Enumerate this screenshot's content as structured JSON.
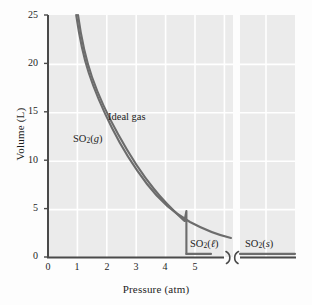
{
  "chart_data": {
    "type": "line",
    "title": "",
    "xlabel": "Pressure (atm)",
    "ylabel": "Volume (L)",
    "xlim": [
      0,
      9
    ],
    "ylim": [
      0,
      25
    ],
    "xticks": [
      "0",
      "1",
      "2",
      "3",
      "4",
      "5"
    ],
    "yticks": [
      "0",
      "5",
      "10",
      "15",
      "20",
      "25"
    ],
    "grid": true,
    "grid_color": "#ffffff",
    "plot_background": "#ebebeb",
    "axis_break": {
      "present": true,
      "symbol": ")(",
      "x_position": 5.6,
      "note": "x-axis is broken after 5 atm"
    },
    "series": [
      {
        "name": "Ideal gas",
        "color": "#6c6c6c",
        "label_x": 2.05,
        "label_y": 13.4,
        "comment": "PV = nRT hyperbola, continues smoothly past condensation pressure",
        "points": [
          [
            0.96,
            25.0
          ],
          [
            1.0,
            24.0
          ],
          [
            1.1,
            21.8
          ],
          [
            1.2,
            20.0
          ],
          [
            1.3,
            18.5
          ],
          [
            1.4,
            17.1
          ],
          [
            1.5,
            16.0
          ],
          [
            1.6,
            15.0
          ],
          [
            1.7,
            14.1
          ],
          [
            1.8,
            13.3
          ],
          [
            2.0,
            12.0
          ],
          [
            2.2,
            10.9
          ],
          [
            2.4,
            10.0
          ],
          [
            2.6,
            9.2
          ],
          [
            2.8,
            8.6
          ],
          [
            3.0,
            8.0
          ],
          [
            3.25,
            7.4
          ],
          [
            3.5,
            6.9
          ],
          [
            3.75,
            6.4
          ],
          [
            4.0,
            6.0
          ],
          [
            4.25,
            5.65
          ],
          [
            4.5,
            5.35
          ],
          [
            4.6,
            5.22
          ],
          [
            5.0,
            4.8
          ],
          [
            5.4,
            4.45
          ],
          [
            5.8,
            4.2
          ],
          [
            6.0,
            4.1
          ]
        ]
      },
      {
        "name": "SO2(g)",
        "color": "#6c6c6c",
        "label_x": 1.05,
        "label_y": 12.1,
        "comment": "Real gas curve lies below ideal, drops vertically at condensation pressure 4.6 atm",
        "points": [
          [
            1.02,
            25.0
          ],
          [
            1.1,
            22.8
          ],
          [
            1.2,
            20.3
          ],
          [
            1.3,
            18.4
          ],
          [
            1.4,
            16.9
          ],
          [
            1.5,
            15.7
          ],
          [
            1.6,
            14.6
          ],
          [
            1.7,
            13.7
          ],
          [
            1.8,
            12.9
          ],
          [
            2.0,
            11.5
          ],
          [
            2.2,
            10.4
          ],
          [
            2.4,
            9.4
          ],
          [
            2.6,
            8.6
          ],
          [
            2.8,
            7.9
          ],
          [
            3.0,
            7.3
          ],
          [
            3.25,
            6.7
          ],
          [
            3.5,
            6.1
          ],
          [
            3.75,
            5.65
          ],
          [
            4.0,
            5.3
          ],
          [
            4.25,
            5.0
          ],
          [
            4.45,
            4.85
          ],
          [
            4.6,
            4.75
          ]
        ],
        "condensation_pressure": 4.6,
        "condensation_volume_gas": 4.75,
        "condensation_volume_liquid": 0.32
      },
      {
        "name": "SO2(l)",
        "color": "#6c6c6c",
        "label_x": 5.02,
        "label_y": 1.35,
        "comment": "Liquid phase, nearly incompressible flat line",
        "points": [
          [
            4.6,
            0.32
          ],
          [
            5.55,
            0.32
          ]
        ]
      },
      {
        "name": "SO2(s)",
        "color": "#6c6c6c",
        "label_x": 6.55,
        "label_y": 1.35,
        "comment": "Solid phase after axis break, nearly incompressible flat line",
        "points": [
          [
            5.85,
            0.32
          ],
          [
            8.65,
            0.32
          ]
        ]
      }
    ],
    "annotations": [
      {
        "text": "Ideal gas",
        "x": 2.05,
        "y": 13.4
      },
      {
        "text": "SO2(g)",
        "html": "SO<sub>2</sub>(<i>g</i>)",
        "x": 1.05,
        "y": 12.1
      },
      {
        "text": "SO2(l)",
        "html": "SO<sub>2</sub>(<i>ℓ</i>)",
        "x": 5.02,
        "y": 1.35
      },
      {
        "text": "SO2(s)",
        "html": "SO<sub>2</sub>(<i>s</i>)",
        "x": 6.55,
        "y": 1.35
      }
    ]
  },
  "labels": {
    "x_title": "Pressure (atm)",
    "y_title": "Volume (L)",
    "ideal_gas": "Ideal gas"
  }
}
